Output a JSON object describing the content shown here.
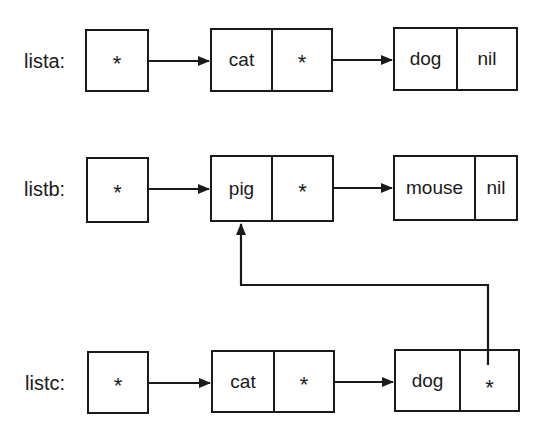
{
  "diagram": {
    "type": "linked-list-cons-cells",
    "rows": [
      {
        "label": "lista:",
        "head_pointer": "*",
        "cells": [
          {
            "car": "cat",
            "cdr": "*"
          },
          {
            "car": "dog",
            "cdr": "nil"
          }
        ]
      },
      {
        "label": "listb:",
        "head_pointer": "*",
        "cells": [
          {
            "car": "pig",
            "cdr": "*"
          },
          {
            "car": "mouse",
            "cdr": "nil"
          }
        ]
      },
      {
        "label": "listc:",
        "head_pointer": "*",
        "cells": [
          {
            "car": "cat",
            "cdr": "*"
          },
          {
            "car": "dog",
            "cdr": "*"
          }
        ]
      }
    ],
    "shared_link": {
      "from": "listc.cells.1.cdr",
      "to": "listb.cells.0",
      "description": "listc's last cdr points to listb's pig cell"
    },
    "colors": {
      "ink": "#1a1a1a",
      "background": "#ffffff"
    }
  }
}
